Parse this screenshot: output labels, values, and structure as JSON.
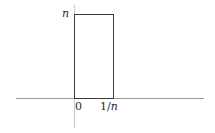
{
  "diagram": {
    "type": "rectangle-function-plot",
    "labels": {
      "height": "n",
      "origin": "0",
      "width_numerator": "1/",
      "width_variable": "n"
    },
    "colors": {
      "rectangle_stroke": "#3a3a3a",
      "x_axis": "#9a9a9a",
      "y_axis": "#c8c8c8",
      "text": "#2a2a2a",
      "background": "#ffffff"
    }
  }
}
